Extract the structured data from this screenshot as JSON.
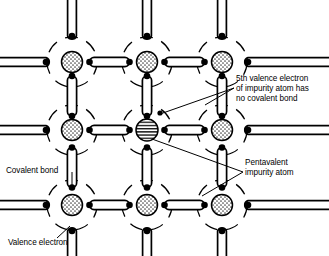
{
  "figure": {
    "type": "diagram",
    "width": 329,
    "height": 256,
    "background_color": "#ffffff",
    "line_color": "#000000"
  },
  "annotations": {
    "fifth_electron": {
      "name": "5th-valence-electron-label",
      "lines": [
        "5th valence electron",
        "of impurity atom has",
        "no covalent bond"
      ],
      "text": "5th valence electron\nof impurity atom has\nno covalent bond",
      "anchor": "free-electron-dot",
      "position": "right-upper"
    },
    "pentavalent": {
      "name": "pentavalent-impurity-atom-label",
      "lines": [
        "Pentavalent",
        "impurity atom"
      ],
      "text": "Pentavalent\nimpurity atom",
      "anchor": "center-impurity-atom",
      "position": "right-lower"
    },
    "covalent_bond": {
      "name": "covalent-bond-label",
      "lines": [
        "Covalent bond"
      ],
      "text": "Covalent bond",
      "anchor": "vertical-bond-left-column",
      "position": "left-middle"
    },
    "valence_electron": {
      "name": "valence-electron-label",
      "lines": [
        "Valence electron"
      ],
      "text": "Valence electron",
      "anchor": "bottom-left-electron-dot",
      "position": "bottom-left"
    }
  },
  "lattice": {
    "rows": 3,
    "columns": 3,
    "column_x": [
      72,
      147,
      222
    ],
    "row_y": [
      62,
      130,
      205
    ],
    "atom_core_radius": 10.5,
    "shell_radius": 25,
    "shell_style": "dashed-arc",
    "bond_length": 52,
    "bond_thickness": 9,
    "electron_radius": 3.2,
    "atoms": [
      {
        "id": "a00",
        "row": 0,
        "col": 0,
        "cx": 72,
        "cy": 62,
        "kind": "silicon",
        "fill": "stipple"
      },
      {
        "id": "a01",
        "row": 0,
        "col": 1,
        "cx": 147,
        "cy": 62,
        "kind": "silicon",
        "fill": "stipple"
      },
      {
        "id": "a02",
        "row": 0,
        "col": 2,
        "cx": 222,
        "cy": 62,
        "kind": "silicon",
        "fill": "stipple"
      },
      {
        "id": "a10",
        "row": 1,
        "col": 0,
        "cx": 72,
        "cy": 130,
        "kind": "silicon",
        "fill": "stipple"
      },
      {
        "id": "a11",
        "row": 1,
        "col": 1,
        "cx": 147,
        "cy": 130,
        "kind": "pentavalent-impurity",
        "fill": "horizontal-hatch"
      },
      {
        "id": "a12",
        "row": 1,
        "col": 2,
        "cx": 222,
        "cy": 130,
        "kind": "silicon",
        "fill": "stipple"
      },
      {
        "id": "a20",
        "row": 2,
        "col": 0,
        "cx": 72,
        "cy": 205,
        "kind": "silicon",
        "fill": "stipple"
      },
      {
        "id": "a21",
        "row": 2,
        "col": 1,
        "cx": 147,
        "cy": 205,
        "kind": "silicon",
        "fill": "stipple"
      },
      {
        "id": "a22",
        "row": 2,
        "col": 2,
        "cx": 222,
        "cy": 205,
        "kind": "silicon",
        "fill": "stipple"
      }
    ],
    "free_electron": {
      "name": "free-electron-dot",
      "cx": 160,
      "cy": 113,
      "radius": 2.6
    }
  }
}
